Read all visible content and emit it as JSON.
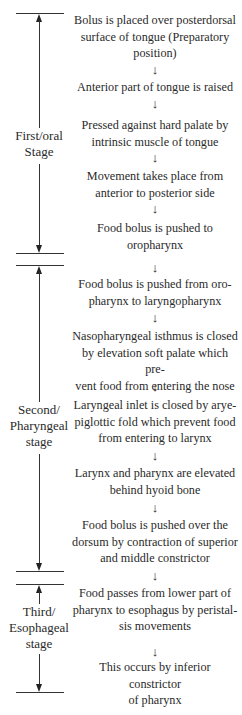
{
  "stages": [
    {
      "label_line1": "First/oral",
      "label_line2": "Stage",
      "label_line3": ""
    },
    {
      "label_line1": "Second/",
      "label_line2": "Pharyngeal",
      "label_line3": "stage"
    },
    {
      "label_line1": "Third/",
      "label_line2": "Esophageal",
      "label_line3": "stage"
    }
  ],
  "steps": [
    {
      "lines": [
        "Bolus is placed over posterdorsal",
        "surface of tongue (Preparatory",
        "position)"
      ]
    },
    {
      "lines": [
        "Anterior part of tongue is raised"
      ]
    },
    {
      "lines": [
        "Pressed against hard palate by",
        "intrinsic muscle of tongue"
      ]
    },
    {
      "lines": [
        "Movement takes place from",
        "anterior to posterior side"
      ]
    },
    {
      "lines": [
        "Food bolus is pushed to",
        "oropharynx"
      ]
    },
    {
      "lines": [
        "Food bolus is pushed from oro-",
        "pharynx to laryngopharynx"
      ]
    },
    {
      "lines": [
        "Nasopharyngeal isthmus is closed",
        "by elevation soft palate which pre-",
        "vent food from entering the nose"
      ]
    },
    {
      "lines": [
        "Laryngeal inlet is closed by arye-",
        "piglottic fold which prevent food",
        "from entering to larynx"
      ]
    },
    {
      "lines": [
        "Larynx and pharynx are elevated",
        "behind hyoid bone"
      ]
    },
    {
      "lines": [
        "Food bolus is pushed over the",
        "dorsum by contraction of superior",
        "and middle constrictor"
      ]
    },
    {
      "lines": [
        "Food passes from lower part of",
        "pharynx to esophagus by peristal-",
        "sis movements"
      ]
    },
    {
      "lines": [
        "This occurs by inferior constrictor",
        "of pharynx"
      ]
    }
  ],
  "flow_arrow_glyph": "↓",
  "colors": {
    "line": "#333333",
    "text": "#2a2a2a",
    "background": "#ffffff"
  }
}
